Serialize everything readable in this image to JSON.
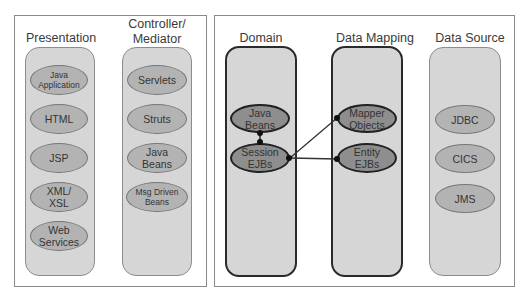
{
  "left_panel": {
    "columns": [
      {
        "title": "Presentation",
        "items": [
          "Java\nApplication",
          "HTML",
          "JSP",
          "XML/\nXSL",
          "Web\nServices"
        ]
      },
      {
        "title": "Controller/\nMediator",
        "items": [
          "Servlets",
          "Struts",
          "Java\nBeans",
          "Msg Driven\nBeans"
        ]
      }
    ]
  },
  "right_panel": {
    "columns": [
      {
        "title": "Domain",
        "items": [
          "Java\nBeans",
          "Session\nEJBs"
        ]
      },
      {
        "title": "Data Mapping",
        "items": [
          "Mapper\nObjects",
          "Entity\nEJBs"
        ]
      },
      {
        "title": "Data Source",
        "items": [
          "JDBC",
          "CICS",
          "JMS"
        ]
      }
    ]
  },
  "connections": [
    {
      "from": "Java Beans (Domain)",
      "to": "Session EJBs"
    },
    {
      "from": "Session EJBs",
      "to": "Mapper Objects"
    },
    {
      "from": "Session EJBs",
      "to": "Entity EJBs"
    }
  ],
  "colors": {
    "column_fill": "#d6d6d6",
    "ellipse_light": "#b3b3b3",
    "ellipse_dark": "#8e8e8e",
    "dark_border": "#222222"
  }
}
